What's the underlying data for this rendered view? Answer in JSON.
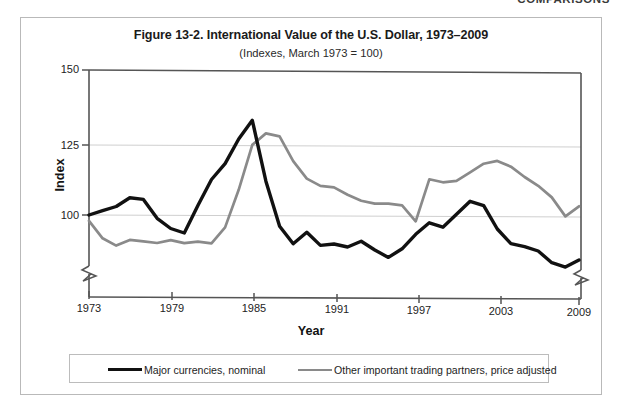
{
  "page_header": {
    "text": "COMPARISONS",
    "dash_icon": "em-dash-icon"
  },
  "figure": {
    "title": "Figure 13-2. International Value of the U.S. Dollar, 1973–2009",
    "subtitle": "(Indexes, March 1973 = 100)"
  },
  "legend": {
    "entries": [
      {
        "label": "Major currencies, nominal",
        "color": "#111111",
        "swatch_icon": "line-swatch-black-icon"
      },
      {
        "label": "Other important trading partners, price adjusted",
        "color": "#8a8a8a",
        "swatch_icon": "line-swatch-gray-icon"
      }
    ]
  },
  "chart_data": {
    "type": "line",
    "title": "Figure 13-2. International Value of the U.S. Dollar, 1973–2009",
    "subtitle": "(Indexes, March 1973 = 100)",
    "xlabel": "Year",
    "ylabel": "Index",
    "xlim": [
      1973,
      2009
    ],
    "ylim": [
      85,
      150
    ],
    "y_axis_break": true,
    "y_axis_break_note": "axis broken below 100; baseline is not zero",
    "grid": "horizontal gridlines at 100, 125, 150",
    "legend_position": "below plot, inside bordered box",
    "yticks": [
      100,
      125,
      150
    ],
    "ytick_labels": [
      "100",
      "125",
      "150"
    ],
    "xticks": [
      1973,
      1979,
      1985,
      1991,
      1997,
      2003,
      2009
    ],
    "xtick_labels": [
      "1973",
      "1979",
      "1985",
      "1991",
      "1997",
      "2003",
      "2009"
    ],
    "x": [
      1973,
      1974,
      1975,
      1976,
      1977,
      1978,
      1979,
      1980,
      1981,
      1982,
      1983,
      1984,
      1985,
      1986,
      1987,
      1988,
      1989,
      1990,
      1991,
      1992,
      1993,
      1994,
      1995,
      1996,
      1997,
      1998,
      1999,
      2000,
      2001,
      2002,
      2003,
      2004,
      2005,
      2006,
      2007,
      2008,
      2009
    ],
    "series": [
      {
        "name": "Major currencies, nominal",
        "color": "#111111",
        "values": [
          100.0,
          101.5,
          103.0,
          106.0,
          105.5,
          99.0,
          95.5,
          94.0,
          103.5,
          112.5,
          118.0,
          126.5,
          133.0,
          112.0,
          96.5,
          90.5,
          94.5,
          90.0,
          90.5,
          89.5,
          91.5,
          88.5,
          86.0,
          89.0,
          94.0,
          98.0,
          96.5,
          101.0,
          105.5,
          104.0,
          96.0,
          91.0,
          90.0,
          88.5,
          84.5,
          83.0,
          85.5
        ]
      },
      {
        "name": "Other important trading partners, price adjusted",
        "color": "#8a8a8a",
        "values": [
          98.0,
          92.0,
          89.5,
          91.5,
          91.0,
          90.5,
          91.5,
          90.5,
          91.0,
          90.5,
          96.0,
          109.0,
          124.5,
          128.5,
          127.5,
          119.0,
          113.0,
          110.5,
          110.0,
          107.5,
          105.5,
          104.5,
          104.5,
          104.0,
          98.5,
          113.0,
          112.0,
          112.5,
          115.5,
          118.5,
          119.5,
          117.5,
          114.0,
          111.0,
          107.0,
          100.5,
          104.0
        ]
      }
    ]
  }
}
